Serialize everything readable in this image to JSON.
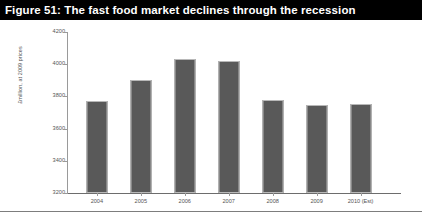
{
  "figure": {
    "title": "Figure 51: The fast food market declines through the recession"
  },
  "chart_data": {
    "type": "bar",
    "title": "Figure 51: The fast food market declines through the recession",
    "xlabel": "",
    "ylabel": "£million, at 2009 prices",
    "categories": [
      "2004",
      "2005",
      "2006",
      "2007",
      "2008",
      "2009",
      "2010 (Est)"
    ],
    "values": [
      3770,
      3900,
      4030,
      4020,
      3780,
      3745,
      3750
    ],
    "series": [
      {
        "name": "Fast food market value",
        "values": [
          3770,
          3900,
          4030,
          4020,
          3780,
          3745,
          3750
        ]
      }
    ],
    "ylim": [
      3200,
      4200
    ],
    "yticks": [
      "3200",
      "3400",
      "3600",
      "3800",
      "4000",
      "4200"
    ],
    "ytick_values": [
      3200,
      3400,
      3600,
      3800,
      4000,
      4200
    ],
    "grid": false,
    "legend": "none",
    "bar_color": "#595959",
    "axis_color": "#9a9a9a",
    "title_band_color": "#000000",
    "title_text_color": "#ffffff"
  }
}
